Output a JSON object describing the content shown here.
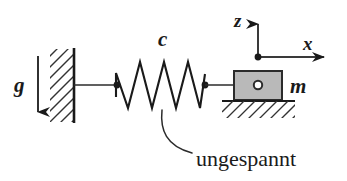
{
  "figure": {
    "type": "mechanics-free-body-diagram",
    "background_color": "#ffffff",
    "ink_color": "#1a1a1a",
    "width": 347,
    "height": 181
  },
  "labels": {
    "gravity": "g",
    "spring_stiffness": "c",
    "mass": "m",
    "axis_vertical": "z",
    "axis_horizontal": "x",
    "annotation": "ungespannt"
  },
  "elements": {
    "gravity_arrow": {
      "name": "gravity-arrow",
      "direction": "down",
      "label": "g",
      "x": 38,
      "y_start": 56,
      "y_end": 124
    },
    "wall": {
      "name": "fixed-wall",
      "hatch_direction": "up-right",
      "x": 74,
      "y_top": 49,
      "y_bottom": 122,
      "hatch_width": 24
    },
    "spring": {
      "name": "spring-coil",
      "label": "c",
      "coil_count": 4,
      "x_start": 114,
      "x_end": 207,
      "y_center": 85,
      "amplitude": 26,
      "end_dot_left": true,
      "end_dot_right": true
    },
    "mass_block": {
      "name": "mass-block",
      "label": "m",
      "fill_color": "#b9b9b9",
      "border_color": "#2b2b2b",
      "x": 234,
      "y": 71,
      "width": 48,
      "height": 29,
      "pin_joint": true
    },
    "ground": {
      "name": "ground-support",
      "hatch_direction": "down-right",
      "x_start": 222,
      "x_end": 295,
      "y": 101,
      "hatch_depth": 16
    },
    "axes": {
      "name": "coordinate-axes",
      "origin_x": 258,
      "origin_y": 57,
      "z_tip_y": 12,
      "x_tip_x": 336,
      "origin_dot": true
    },
    "leader": {
      "name": "annotation-leader-line",
      "from_x": 162,
      "from_y": 112,
      "to_x": 190,
      "to_y": 155
    }
  },
  "colors": {
    "ink": "#1a1a1a",
    "hatch": "#333333",
    "block_fill": "#b9b9b9",
    "block_border": "#2b2b2b",
    "axis": "#3a3a3a",
    "background": "#ffffff"
  }
}
